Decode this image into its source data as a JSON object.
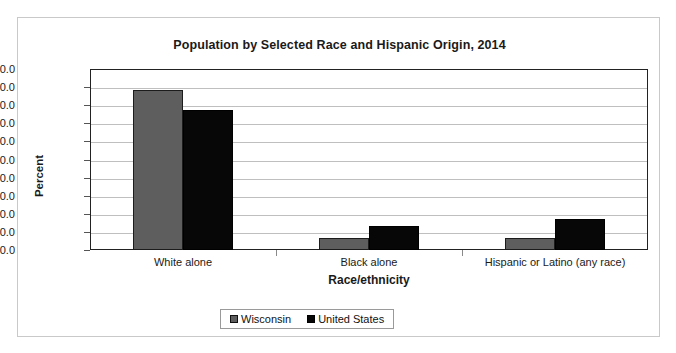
{
  "chart_data": {
    "type": "bar",
    "title": "Population by Selected Race and Hispanic Origin, 2014",
    "xlabel": "Race/ethnicity",
    "ylabel": "Percent",
    "ylim": [
      0.0,
      100.0
    ],
    "ytick_step": 10.0,
    "grid": true,
    "legend_position": "bottom-center",
    "categories": [
      "White alone",
      "Black alone",
      "Hispanic or Latino (any race)"
    ],
    "yticks": [
      "100.0",
      "90.0",
      "80.0",
      "70.0",
      "60.0",
      "50.0",
      "40.0",
      "30.0",
      "20.0",
      "10.0",
      "0.0"
    ],
    "series": [
      {
        "name": "Wisconsin",
        "color": "#5e5e5e",
        "values": [
          88.5,
          6.5,
          6.5
        ]
      },
      {
        "name": "United States",
        "color": "#070707",
        "values": [
          77.4,
          13.2,
          17.3
        ]
      }
    ]
  }
}
